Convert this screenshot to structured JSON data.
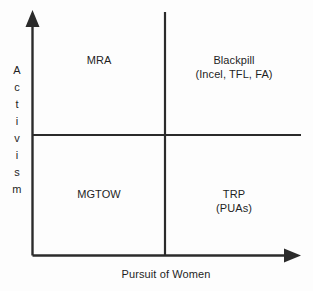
{
  "diagram": {
    "type": "two-axis-quadrant-chart",
    "axes": {
      "x_label": "Pursuit of Women",
      "y_label": "Activism",
      "y_label_letters": [
        "A",
        "c",
        "t",
        "i",
        "v",
        "i",
        "s",
        "m"
      ],
      "x_arrow_direction": "right",
      "y_arrow_direction": "up"
    },
    "quadrants": [
      {
        "position": "top-left",
        "line1": "MRA",
        "line2": ""
      },
      {
        "position": "top-right",
        "line1": "Blackpill",
        "line2": "(Incel, TFL, FA)"
      },
      {
        "position": "bottom-left",
        "line1": "MGTOW",
        "line2": ""
      },
      {
        "position": "bottom-right",
        "line1": "TRP",
        "line2": "(PUAs)"
      }
    ],
    "colors": {
      "line": "#2b2b2b",
      "text": "#1f1f1f",
      "background": "#fdfdfd"
    }
  }
}
